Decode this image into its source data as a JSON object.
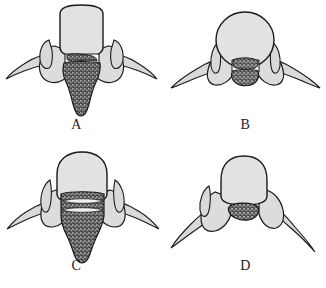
{
  "figure": {
    "kind": "anatomical-line-drawing-grid",
    "background_color": "#ffffff",
    "rows": 2,
    "columns": 2,
    "panel_count": 4
  },
  "style": {
    "outline_color": "#1a1a1a",
    "bone_fill": "#dcdcdc",
    "body_fill": "#e2e2e2",
    "process_fill": "#d9d9d9",
    "lesion_fill": "#4a4a4a",
    "lesion_speckle_light": "#bdbdbd",
    "lesion_speckle_dark": "#2b2b2b",
    "canal_fill": "#ffffff"
  },
  "panels": [
    {
      "id": "panel-a",
      "label": "A",
      "subject": "axial vertebra with large stippled mass extending inferiorly from the vertebral body",
      "body_shape": "rounded-square",
      "lesion_extent": "large-descending",
      "lesion_position": "central-posterior"
    },
    {
      "id": "panel-b",
      "label": "B",
      "subject": "axial vertebra with small bilobed stippled mass confined to the canal",
      "body_shape": "round",
      "lesion_extent": "small-confined",
      "lesion_position": "central-canal"
    },
    {
      "id": "panel-c",
      "label": "C",
      "subject": "axial vertebra with broad stippled mass spanning the canal and extending inferiorly",
      "body_shape": "rounded-dome",
      "lesion_extent": "broad-descending",
      "lesion_position": "central-posterior"
    },
    {
      "id": "panel-d",
      "label": "D",
      "subject": "axial vertebra with small oval stippled mass and asymmetric processes",
      "body_shape": "dome",
      "lesion_extent": "small-oval",
      "lesion_position": "central-canal"
    }
  ]
}
